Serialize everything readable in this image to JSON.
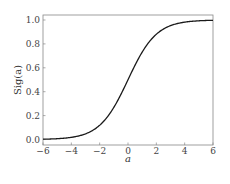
{
  "chart_data": {
    "type": "line",
    "title": "",
    "xlabel": "a",
    "ylabel": "Sig(a)",
    "xlim": [
      -6,
      6
    ],
    "ylim": [
      -0.02,
      1.05
    ],
    "grid": false,
    "legend": null,
    "xticks": [
      -6,
      -4,
      -2,
      0,
      2,
      4,
      6
    ],
    "xtick_labels": [
      "−6",
      "−4",
      "−2",
      "0",
      "2",
      "4",
      "6"
    ],
    "yticks": [
      0.0,
      0.2,
      0.4,
      0.6,
      0.8,
      1.0
    ],
    "ytick_labels": [
      "0.0",
      "0.2",
      "0.4",
      "0.6",
      "0.8",
      "1.0"
    ],
    "series": [
      {
        "name": "Sig(a)",
        "function": "1/(1+exp(-a))",
        "color": "#1a1a1a",
        "x": [
          -6,
          -5,
          -4,
          -3,
          -2,
          -1,
          0,
          1,
          2,
          3,
          4,
          5,
          6
        ],
        "values": [
          0.0025,
          0.0067,
          0.018,
          0.047,
          0.119,
          0.269,
          0.5,
          0.731,
          0.881,
          0.953,
          0.982,
          0.993,
          0.9975
        ]
      }
    ]
  }
}
